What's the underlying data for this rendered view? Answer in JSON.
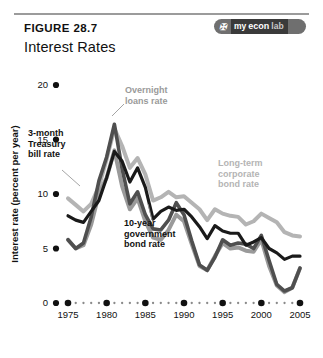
{
  "figure": {
    "number_label": "FIGURE 28.7",
    "title": "Interest Rates",
    "logo": {
      "mark": "✠",
      "part1": "my",
      "part2": "econ",
      "part3": "lab",
      "name": "myeconlab"
    }
  },
  "colors": {
    "overnight": "#4f4f4f",
    "tbill": "#9a9a9a",
    "govbond": "#1a1a1a",
    "corporate": "#b4b4b4",
    "axis": "#111111"
  },
  "chart_data": {
    "type": "line",
    "title": "Interest Rates",
    "xlabel": "Year",
    "ylabel": "Interest rate (percent per year)",
    "xlim": [
      1975,
      2005
    ],
    "ylim": [
      0,
      20
    ],
    "xticks": [
      1975,
      1980,
      1985,
      1990,
      1995,
      2000,
      2005
    ],
    "xticklabels": [
      "1975",
      "1980",
      "1985",
      "1990",
      "1995",
      "2000",
      "2005"
    ],
    "yticks": [
      0,
      5,
      10,
      15,
      20
    ],
    "yticklabels": [
      "0",
      "5",
      "10",
      "15",
      "20"
    ],
    "grid": false,
    "legend": "inline-annotations",
    "minor_xticks_every": 1,
    "x": [
      1975,
      1976,
      1977,
      1978,
      1979,
      1980,
      1981,
      1982,
      1983,
      1984,
      1985,
      1986,
      1987,
      1988,
      1989,
      1990,
      1991,
      1992,
      1993,
      1994,
      1995,
      1996,
      1997,
      1998,
      1999,
      2000,
      2001,
      2002,
      2003,
      2004,
      2005
    ],
    "series": [
      {
        "name": "Overnight loans rate",
        "color": "#4f4f4f",
        "label_text": "Overnight\nloans rate",
        "label_lines": [
          "Overnight",
          "loans rate"
        ],
        "values": [
          5.8,
          5.0,
          5.5,
          7.9,
          11.2,
          13.4,
          16.4,
          12.3,
          9.1,
          10.2,
          8.1,
          6.8,
          6.7,
          7.6,
          9.2,
          8.1,
          5.7,
          3.5,
          3.0,
          4.2,
          5.8,
          5.3,
          5.5,
          5.4,
          5.0,
          6.2,
          3.9,
          1.7,
          1.1,
          1.4,
          3.2
        ]
      },
      {
        "name": "3-month Treasury bill rate",
        "color": "#9a9a9a",
        "label_text": "3-month\nTreasury\nbill rate",
        "label_lines": [
          "3-month",
          "Treasury",
          "bill rate"
        ],
        "values": [
          5.8,
          5.0,
          5.3,
          7.2,
          10.0,
          11.5,
          14.0,
          10.7,
          8.6,
          9.6,
          7.5,
          6.0,
          5.8,
          6.7,
          8.1,
          7.5,
          5.4,
          3.4,
          3.0,
          4.3,
          5.5,
          5.0,
          5.1,
          4.8,
          4.7,
          5.8,
          3.4,
          1.6,
          1.0,
          1.4,
          3.2
        ]
      },
      {
        "name": "10-year government bond rate",
        "color": "#1a1a1a",
        "label_text": "10-year\ngovernment\nbond rate",
        "label_lines": [
          "10-year",
          "government",
          "bond rate"
        ],
        "values": [
          8.0,
          7.6,
          7.4,
          8.4,
          9.4,
          11.5,
          13.9,
          13.0,
          11.1,
          12.4,
          10.6,
          7.7,
          8.4,
          8.8,
          8.5,
          8.6,
          7.9,
          7.0,
          5.9,
          7.1,
          6.6,
          6.4,
          6.4,
          5.3,
          5.6,
          6.0,
          5.0,
          4.6,
          4.0,
          4.3,
          4.3
        ]
      },
      {
        "name": "Long-term corporate bond rate",
        "color": "#b4b4b4",
        "label_text": "Long-term\ncorporate\nbond rate",
        "label_lines": [
          "Long-term",
          "corporate",
          "bond rate"
        ],
        "values": [
          9.6,
          9.0,
          8.4,
          9.1,
          10.7,
          13.2,
          16.0,
          14.4,
          12.4,
          13.3,
          11.8,
          9.4,
          9.7,
          10.2,
          9.7,
          9.8,
          9.2,
          8.6,
          7.6,
          8.6,
          8.2,
          8.0,
          7.9,
          7.2,
          7.5,
          8.2,
          7.8,
          7.4,
          6.5,
          6.2,
          6.1
        ]
      }
    ]
  },
  "annotations": {
    "overnight_label": "Overnight loans rate",
    "tbill_label": "3-month Treasury bill rate",
    "govbond_label": "10-year government bond rate",
    "corporate_label": "Long-term corporate bond rate"
  }
}
